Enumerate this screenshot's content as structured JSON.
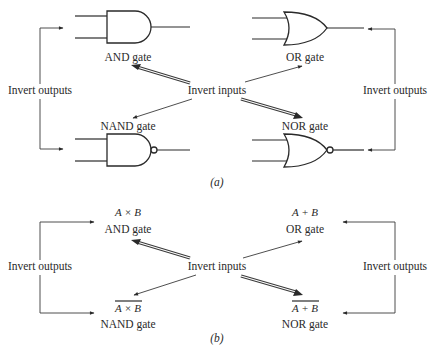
{
  "figure": {
    "panel_a": {
      "caption": "(a)",
      "gates": {
        "and": {
          "label": "AND gate"
        },
        "or": {
          "label": "OR gate"
        },
        "nand": {
          "label": "NAND gate"
        },
        "nor": {
          "label": "NOR gate"
        }
      },
      "invert_inputs": "Invert inputs",
      "invert_outputs_left": "Invert outputs",
      "invert_outputs_right": "Invert outputs"
    },
    "panel_b": {
      "caption": "(b)",
      "expressions": {
        "and": {
          "expr": "A × B",
          "label": "AND gate"
        },
        "or": {
          "expr": "A + B",
          "label": "OR gate"
        },
        "nand": {
          "expr": "A × B",
          "label": "NAND gate",
          "overline": true
        },
        "nor": {
          "expr": "A + B",
          "label": "NOR gate",
          "overline": true
        }
      },
      "invert_inputs": "Invert inputs",
      "invert_outputs_left": "Invert outputs",
      "invert_outputs_right": "Invert outputs"
    }
  },
  "colors": {
    "ink": "#2a2a2a",
    "background": "#ffffff"
  }
}
